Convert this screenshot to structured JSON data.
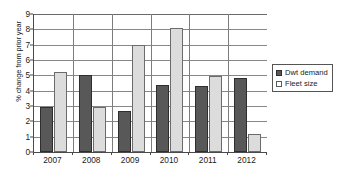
{
  "chart_data": {
    "type": "bar",
    "title": "",
    "xlabel": "",
    "ylabel": "% change from prior year",
    "categories": [
      "2007",
      "2008",
      "2009",
      "2010",
      "2011",
      "2012"
    ],
    "series": [
      {
        "name": "Dwt demand",
        "color": "#585858",
        "values": [
          2.95,
          5.0,
          2.7,
          4.4,
          4.3,
          4.8
        ]
      },
      {
        "name": "Fleet size",
        "color": "#dcdcdc",
        "values": [
          5.2,
          2.95,
          6.95,
          8.1,
          4.95,
          1.2
        ]
      }
    ],
    "ylim": [
      0,
      9
    ],
    "ytick_labels": [
      "0",
      "1",
      "2",
      "3",
      "4",
      "5",
      "6",
      "7",
      "8",
      "9"
    ],
    "ytick_values": [
      0,
      1,
      2,
      3,
      4,
      5,
      6,
      7,
      8,
      9
    ],
    "grid": true,
    "legend_position": "right"
  },
  "legend": {
    "items": [
      {
        "label": "Dwt demand",
        "marker": "filled-square-icon"
      },
      {
        "label": "Fleet size",
        "marker": "hollow-square-icon"
      }
    ]
  }
}
